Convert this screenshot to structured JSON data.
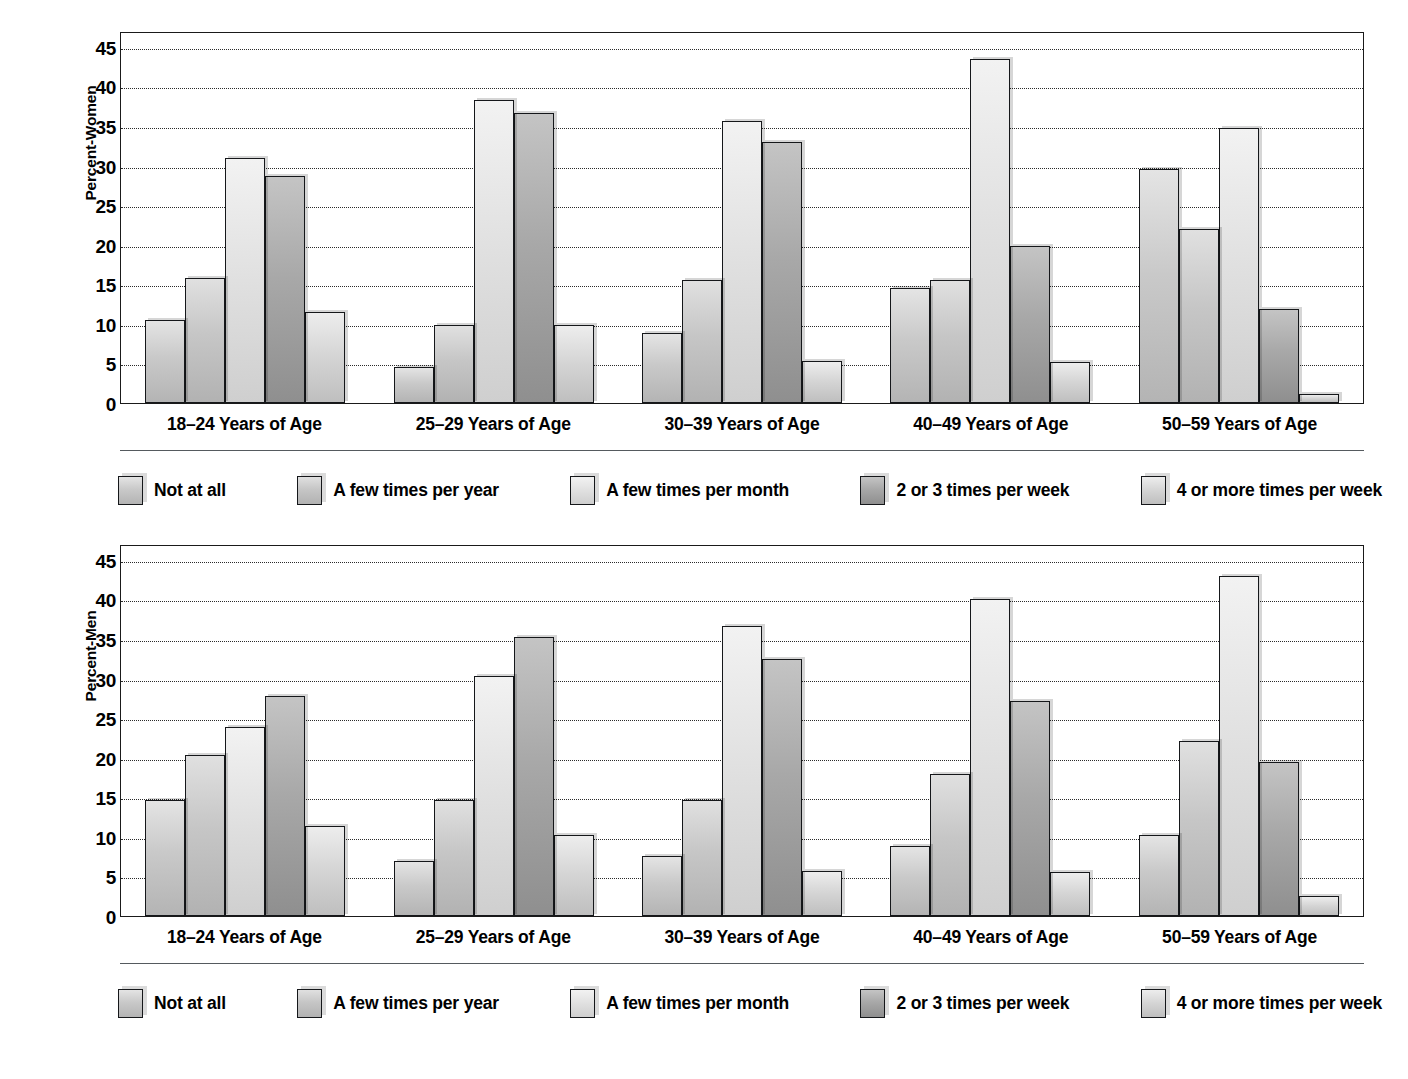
{
  "chart_data": [
    {
      "type": "bar",
      "title": "",
      "xlabel": "",
      "ylabel": "Percent-Women",
      "ylim": [
        0,
        47
      ],
      "yticks": [
        0,
        5,
        10,
        15,
        20,
        25,
        30,
        35,
        40,
        45
      ],
      "grid": true,
      "legend_position": "bottom",
      "categories": [
        "18–24 Years of Age",
        "25–29 Years of Age",
        "30–39 Years of Age",
        "40–49 Years of Age",
        "50–59 Years of Age"
      ],
      "series": [
        {
          "name": "Not at all",
          "values": [
            10.5,
            4.6,
            8.9,
            14.5,
            29.6
          ]
        },
        {
          "name": "A few times per year",
          "values": [
            15.8,
            9.8,
            15.6,
            15.6,
            22.0
          ]
        },
        {
          "name": "A few times per month",
          "values": [
            31.0,
            38.3,
            35.6,
            43.5,
            34.7
          ]
        },
        {
          "name": "2 or 3 times per week",
          "values": [
            28.7,
            36.7,
            33.0,
            19.8,
            11.9
          ]
        },
        {
          "name": "4 or more times per week",
          "values": [
            11.5,
            9.8,
            5.3,
            5.2,
            1.1
          ]
        }
      ]
    },
    {
      "type": "bar",
      "title": "",
      "xlabel": "",
      "ylabel": "Percent-Men",
      "ylim": [
        0,
        47
      ],
      "yticks": [
        0,
        5,
        10,
        15,
        20,
        25,
        30,
        35,
        40,
        45
      ],
      "grid": true,
      "legend_position": "bottom",
      "categories": [
        "18–24 Years of Age",
        "25–29 Years of Age",
        "30–39 Years of Age",
        "40–49 Years of Age",
        "50–59 Years of Age"
      ],
      "series": [
        {
          "name": "Not at all",
          "values": [
            14.7,
            6.9,
            7.6,
            8.8,
            10.2
          ]
        },
        {
          "name": "A few times per year",
          "values": [
            20.3,
            14.7,
            14.7,
            18.0,
            22.1
          ]
        },
        {
          "name": "A few times per month",
          "values": [
            23.9,
            30.3,
            36.6,
            40.0,
            43.0
          ]
        },
        {
          "name": "2 or 3 times per week",
          "values": [
            27.8,
            35.3,
            32.5,
            27.2,
            19.5
          ]
        },
        {
          "name": "4 or more times per week",
          "values": [
            11.4,
            10.2,
            5.7,
            5.5,
            2.5
          ]
        }
      ]
    }
  ],
  "colors": {
    "background": "#ffffff",
    "axis": "#1a1a1a",
    "gridline": "#2b2b2b",
    "rule": "#555a5e",
    "series": [
      "#c9c9c9",
      "#c6c6c6",
      "#e0e0e0",
      "#a8a8a8",
      "#d4d4d4"
    ]
  }
}
